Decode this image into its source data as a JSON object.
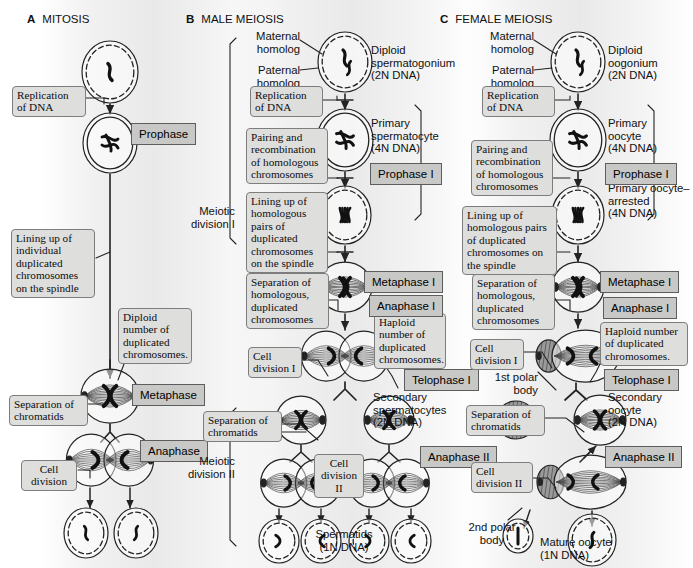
{
  "figure": {
    "columns": [
      {
        "letter": "A",
        "name": "MITOSIS"
      },
      {
        "letter": "B",
        "name": "MALE MEIOSIS"
      },
      {
        "letter": "C",
        "name": "FEMALE MEIOSIS"
      }
    ]
  },
  "mitosis": {
    "notes": {
      "replication": "Replication\nof DNA",
      "lining_up": "Lining up of\nindividual\nduplicated\nchromosomes\non the spindle",
      "diploid_number": "Diploid\nnumber of\nduplicated\nchromosomes.",
      "separation": "Separation of\nchromatids",
      "cell_division": "Cell\ndivision"
    },
    "chips": {
      "prophase": "Prophase",
      "metaphase": "Metaphase",
      "anaphase": "Anaphase"
    }
  },
  "male": {
    "brackets": {
      "division_1": "Meiotic\ndivision I",
      "division_2": "Meiotic\ndivision II"
    },
    "captions": {
      "maternal": "Maternal\nhomolog",
      "paternal": "Paternal\nhomolog",
      "spermatogonium": "Diploid\nspermatogonium\n(2N DNA)",
      "primary_spermatocyte": "Primary\nspermatocyte\n(4N DNA)",
      "secondary_spermatocytes": "Secondary\nspermatocytes\n(2N DNA)",
      "spermatids": "Spermatids\n(1N DNA)"
    },
    "notes": {
      "replication": "Replication\nof DNA",
      "pairing": "Pairing and\nrecombination\nof homologous\nchromosomes",
      "lining_up": "Lining up of\nhomologous\npairs of\nduplicated\nchromosomes\non the spindle",
      "separation_homologous": "Separation of\nhomologous,\nduplicated\nchromosomes",
      "cell_division_1": "Cell\ndivision I",
      "haploid_number": "Haploid\nnumber of\nduplicated\nchromosomes.",
      "separation_chromatids": "Separation of\nchromatids",
      "cell_division_2": "Cell\ndivision\nII"
    },
    "chips": {
      "prophase_1": "Prophase I",
      "metaphase_1": "Metaphase I",
      "anaphase_1": "Anaphase I",
      "telophase_1": "Telophase I",
      "anaphase_2": "Anaphase II"
    }
  },
  "female": {
    "captions": {
      "maternal": "Maternal\nhomolog",
      "paternal": "Paternal\nhomolog",
      "oogonium": "Diploid\noogonium\n(2N DNA)",
      "primary_oocyte": "Primary\noocyte\n(4N DNA)",
      "primary_oocyte_arrested": "Primary oocyte–\narrested\n(4N DNA)",
      "secondary_oocyte": "Secondary\noocyte\n(2N DNA)",
      "first_polar_body": "1st polar\nbody",
      "second_polar_body": "2nd polar\nbody",
      "mature_oocyte": "Mature oocyte\n(1N DNA)"
    },
    "notes": {
      "replication": "Replication\nof DNA",
      "pairing": "Pairing and\nrecombination\nof homologous\nchromosomes",
      "lining_up": "Lining up of\nhomologous pairs\nof duplicated\nchromosomes on\nthe spindle",
      "separation_homologous": "Separation of\nhomologous,\nduplicated\nchromosomes",
      "cell_division_1": "Cell\ndivision I",
      "haploid_number": "Haploid number\nof duplicated\nchromosomes.",
      "separation_chromatids": "Separation of\nchromatids",
      "cell_division_2": "Cell\ndivision II"
    },
    "chips": {
      "prophase_1": "Prophase I",
      "metaphase_1": "Metaphase I",
      "anaphase_1": "Anaphase I",
      "telophase_1": "Telophase I",
      "anaphase_2": "Anaphase II"
    }
  },
  "colors": {
    "note_fill": "#dededd",
    "note_stroke": "#7d7d7d",
    "chip_fill": "#c8c8c7",
    "chip_stroke": "#5d5d5d",
    "ink": "#232323",
    "polar_body_fill": "#8e8e8e"
  }
}
